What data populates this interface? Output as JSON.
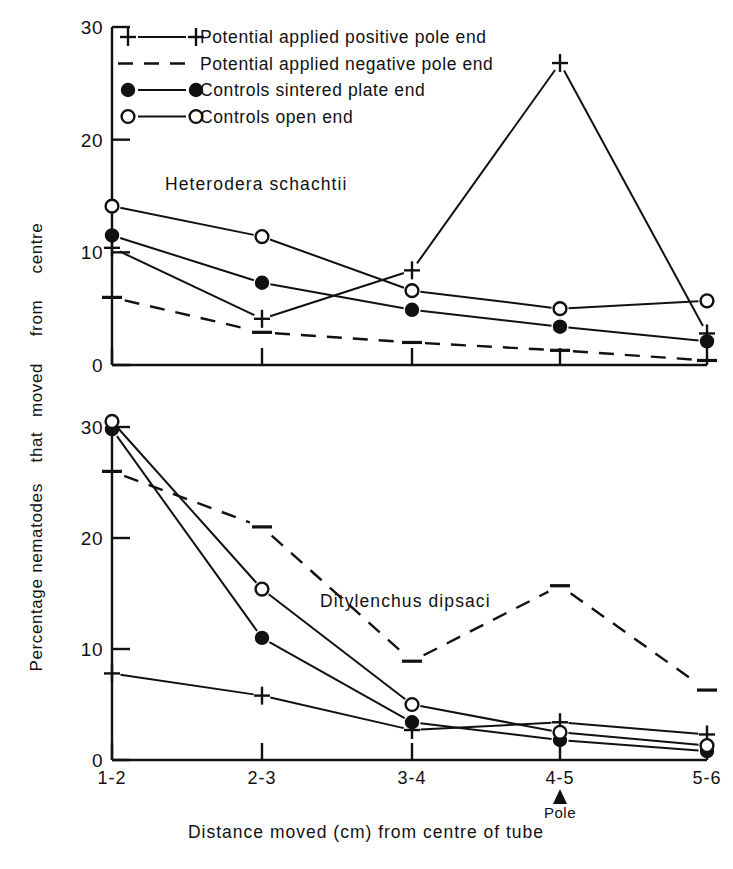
{
  "figure": {
    "background": "#ffffff",
    "ink_color": "#111111",
    "x_axis_title": "Distance   moved   (cm)  from   centre   of   tube",
    "y_axis_title_words": [
      "Percentage",
      "nematodes",
      "that",
      "moved",
      "from",
      "centre"
    ],
    "pole_marker_label": "Pole",
    "pole_marker_icon": "up-triangle-icon",
    "pole_marker_category": "4-5"
  },
  "legend": {
    "items": [
      {
        "key": "positive",
        "marker": "plus-marker",
        "line": "solid",
        "label": "Potential  applied  positive  pole  end"
      },
      {
        "key": "negative",
        "marker": "dash-marker",
        "line": "dashed",
        "label": "Potential  applied  negative  pole  end"
      },
      {
        "key": "control_sintered",
        "marker": "filled-circle-marker",
        "line": "solid",
        "label": "Controls   sintered  plate  end"
      },
      {
        "key": "control_open",
        "marker": "open-circle-marker",
        "line": "solid",
        "label": "Controls   open  end"
      }
    ]
  },
  "chart_data": [
    {
      "type": "line",
      "title": "Heterodera   schachtii",
      "panel": "top",
      "xlabel": "Distance moved (cm) from centre of tube",
      "ylabel": "Percentage nematodes that moved from centre",
      "categories": [
        "1-2",
        "2-3",
        "3-4",
        "4-5",
        "5-6"
      ],
      "ylim": [
        0,
        30
      ],
      "yticks": [
        0,
        10,
        20,
        30
      ],
      "ytick_labels": [
        "0",
        "10",
        "20",
        "30"
      ],
      "grid": false,
      "legend_position": "top-inside",
      "series": [
        {
          "name": "Potential applied positive pole end",
          "marker": "plus",
          "linestyle": "solid",
          "values": [
            10.4,
            4.1,
            8.4,
            26.8,
            2.8
          ]
        },
        {
          "name": "Potential applied negative pole end",
          "marker": "dash",
          "linestyle": "dashed",
          "values": [
            6.0,
            2.9,
            2.0,
            1.3,
            0.4
          ]
        },
        {
          "name": "Controls sintered plate end",
          "marker": "filled-circle",
          "linestyle": "solid",
          "values": [
            11.5,
            7.3,
            4.9,
            3.4,
            2.1
          ]
        },
        {
          "name": "Controls open end",
          "marker": "open-circle",
          "linestyle": "solid",
          "values": [
            14.1,
            11.4,
            6.6,
            5.0,
            5.7
          ]
        }
      ]
    },
    {
      "type": "line",
      "title": "Ditylenchus   dipsaci",
      "panel": "bottom",
      "xlabel": "Distance moved (cm) from centre of tube",
      "ylabel": "Percentage nematodes that moved from centre",
      "categories": [
        "1-2",
        "2-3",
        "3-4",
        "4-5",
        "5-6"
      ],
      "ylim": [
        0,
        30
      ],
      "yticks": [
        0,
        10,
        20,
        30
      ],
      "ytick_labels": [
        "0",
        "10",
        "20",
        "30"
      ],
      "grid": false,
      "legend_position": "none",
      "series": [
        {
          "name": "Potential applied positive pole end",
          "marker": "plus",
          "linestyle": "solid",
          "values": [
            7.8,
            5.8,
            2.7,
            3.4,
            2.3
          ]
        },
        {
          "name": "Potential applied negative pole end",
          "marker": "dash",
          "linestyle": "dashed",
          "values": [
            26.0,
            21.0,
            8.9,
            15.7,
            6.3
          ]
        },
        {
          "name": "Controls sintered plate end",
          "marker": "filled-circle",
          "linestyle": "solid",
          "values": [
            29.8,
            11.0,
            3.4,
            1.8,
            0.8
          ]
        },
        {
          "name": "Controls open end",
          "marker": "open-circle",
          "linestyle": "solid",
          "values": [
            30.5,
            15.4,
            5.0,
            2.5,
            1.3
          ]
        }
      ]
    }
  ]
}
